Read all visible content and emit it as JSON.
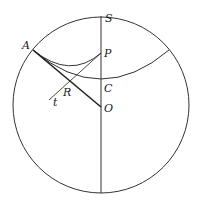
{
  "diagram": {
    "type": "geometry",
    "stroke_color": "#333333",
    "background": "#ffffff",
    "circle": {
      "cx": 101,
      "cy": 105,
      "r": 88
    },
    "points": {
      "S": {
        "label": "S",
        "x": 101,
        "y": 17
      },
      "A": {
        "label": "A",
        "x": 33,
        "y": 50
      },
      "P": {
        "label": "P",
        "x": 101,
        "y": 53
      },
      "C": {
        "label": "C",
        "x": 101,
        "y": 80
      },
      "R": {
        "label": "R",
        "x": 68,
        "y": 82
      },
      "O": {
        "label": "O",
        "x": 101,
        "y": 107
      },
      "t": {
        "label": "t",
        "x": 49,
        "y": 100
      }
    }
  }
}
